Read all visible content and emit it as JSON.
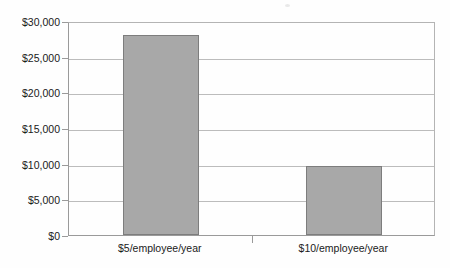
{
  "chart_data": {
    "type": "bar",
    "title": "",
    "subtitle": "",
    "xlabel": "",
    "ylabel": "",
    "categories": [
      "$5/employee/year",
      "$10/employee/year"
    ],
    "values": [
      28000,
      9700
    ],
    "series": [
      {
        "name": "",
        "values": [
          28000,
          9700
        ]
      }
    ],
    "ylim": [
      0,
      30000
    ],
    "y_ticks": [
      0,
      5000,
      10000,
      15000,
      20000,
      25000,
      30000
    ],
    "y_tick_labels": [
      "$0",
      "$5,000",
      "$10,000",
      "$15,000",
      "$20,000",
      "$25,000",
      "$30,000"
    ],
    "grid": true,
    "grid_axis": "y",
    "legend": false,
    "legend_position": "none",
    "orientation": "vertical",
    "bar_fill_color": "#a8a8a8",
    "bar_border_color": "#7d7d7d",
    "gridline_color": "#bcbcbc",
    "axis_color": "#9a9a9a",
    "background_color": "#fefefe",
    "text_color": "#1a1a1a"
  }
}
